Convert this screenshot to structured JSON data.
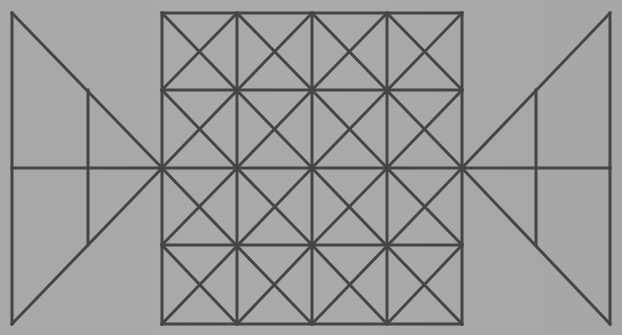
{
  "figure": {
    "background_color": "#a9a9a9",
    "line_color": "#454545",
    "line_width": 3
  },
  "grid": {
    "x_lines": [
      162,
      237,
      312,
      387,
      462
    ],
    "y_lines": [
      13,
      90,
      168,
      245,
      324
    ],
    "diagonals": [
      [
        162,
        13,
        312,
        168
      ],
      [
        312,
        13,
        162,
        168
      ],
      [
        312,
        13,
        462,
        168
      ],
      [
        462,
        13,
        312,
        168
      ],
      [
        162,
        168,
        312,
        324
      ],
      [
        312,
        168,
        162,
        324
      ],
      [
        312,
        168,
        462,
        324
      ],
      [
        462,
        168,
        312,
        324
      ],
      [
        162,
        90,
        237,
        13
      ],
      [
        237,
        13,
        312,
        90
      ],
      [
        312,
        90,
        387,
        13
      ],
      [
        387,
        13,
        462,
        90
      ],
      [
        162,
        90,
        237,
        168
      ],
      [
        237,
        168,
        312,
        90
      ],
      [
        312,
        90,
        387,
        168
      ],
      [
        387,
        168,
        462,
        90
      ],
      [
        162,
        245,
        237,
        168
      ],
      [
        237,
        168,
        312,
        245
      ],
      [
        312,
        245,
        387,
        168
      ],
      [
        387,
        168,
        462,
        245
      ],
      [
        162,
        245,
        237,
        324
      ],
      [
        237,
        324,
        312,
        245
      ],
      [
        312,
        245,
        387,
        324
      ],
      [
        387,
        324,
        462,
        245
      ]
    ]
  },
  "left_triangle": {
    "segments": [
      [
        12,
        13,
        12,
        324
      ],
      [
        12,
        13,
        162,
        168
      ],
      [
        12,
        324,
        162,
        168
      ],
      [
        12,
        168,
        162,
        168
      ],
      [
        88,
        90,
        88,
        245
      ]
    ]
  },
  "right_triangle": {
    "segments": [
      [
        610,
        13,
        610,
        324
      ],
      [
        610,
        13,
        462,
        168
      ],
      [
        610,
        324,
        462,
        168
      ],
      [
        462,
        168,
        610,
        168
      ],
      [
        536,
        90,
        536,
        245
      ]
    ]
  }
}
